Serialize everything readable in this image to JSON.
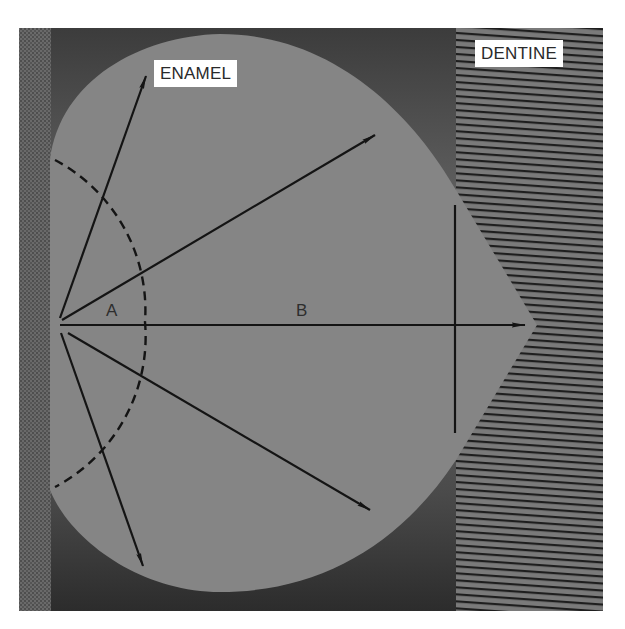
{
  "figure": {
    "regions": {
      "enamel_label": "ENAMEL",
      "dentine_label": "DENTINE"
    },
    "points": {
      "a_label": "A",
      "b_label": "B"
    },
    "colors": {
      "background": "#ffffff",
      "enamel_fill": "#858585",
      "outer_dark": "#4a4a4a",
      "dentine_base": "#7a7a7a",
      "dentine_stripe": "#1e1e1e",
      "left_strip": "#5e5e5e",
      "line": "#141414",
      "label_bg": "#ffffff",
      "label_text": "#2a2a2a"
    },
    "geometry": {
      "origin": [
        60,
        322
      ],
      "arrows": [
        {
          "to": [
            146,
            76
          ]
        },
        {
          "to": [
            375,
            135
          ]
        },
        {
          "to": [
            525,
            325
          ]
        },
        {
          "to": [
            370,
            510
          ]
        },
        {
          "to": [
            143,
            566
          ]
        }
      ],
      "dashed_arc_radius": 85,
      "vertical_line": {
        "x": 455,
        "y1": 205,
        "y2": 433
      }
    }
  }
}
